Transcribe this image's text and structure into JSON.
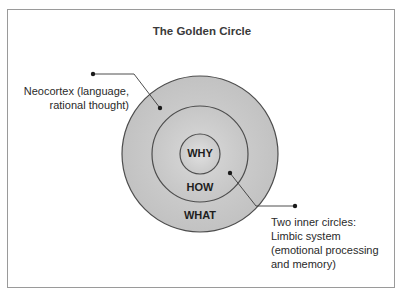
{
  "diagram": {
    "title": "The Golden Circle",
    "circles": [
      {
        "name": "outer",
        "label": "WHAT",
        "cx": 200,
        "cy": 154,
        "r": 78
      },
      {
        "name": "middle",
        "label": "HOW",
        "cx": 200,
        "cy": 154,
        "r": 48
      },
      {
        "name": "inner",
        "label": "WHY",
        "cx": 200,
        "cy": 154,
        "r": 20
      }
    ],
    "annotations": {
      "neocortex": {
        "lines": [
          "Neocortex (language,",
          "rational thought)"
        ]
      },
      "limbic": {
        "lines": [
          "Two inner circles:",
          "Limbic system",
          "(emotional processing",
          "and memory)"
        ]
      }
    },
    "colors": {
      "circle_fill": "#c9c9c9",
      "circle_fill_light": "#dcdcdc",
      "circle_stroke": "#4d4d4d",
      "leader_line": "#3a3a3a",
      "frame_border": "#9a9a9a",
      "text": "#2a2a2a"
    }
  }
}
